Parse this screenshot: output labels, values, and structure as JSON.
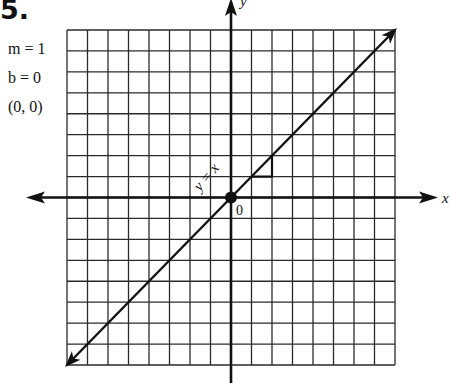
{
  "problem": {
    "number": "5.",
    "slope_label": "m = 1",
    "intercept_label": "b = 0",
    "point_label": "(0, 0)"
  },
  "chart_data": {
    "type": "line",
    "title": "",
    "xlabel": "x",
    "ylabel": "y",
    "xlim": [
      -8,
      8
    ],
    "ylim": [
      -8,
      8
    ],
    "grid": true,
    "series": [
      {
        "name": "y = x",
        "x": [
          -8,
          8
        ],
        "y": [
          -8,
          8
        ]
      }
    ],
    "annotations": [
      {
        "text": "y = x",
        "type": "line-label"
      },
      {
        "text": "0",
        "type": "origin-label",
        "x": 0,
        "y": 0
      },
      {
        "type": "point",
        "x": 0,
        "y": 0
      },
      {
        "type": "slope-triangle",
        "points": [
          [
            1,
            1
          ],
          [
            2,
            1
          ],
          [
            2,
            2
          ]
        ]
      }
    ],
    "slope": 1,
    "intercept": 0
  },
  "colors": {
    "ink": "#111111",
    "grid": "#2a2a2a",
    "background": "#ffffff"
  }
}
